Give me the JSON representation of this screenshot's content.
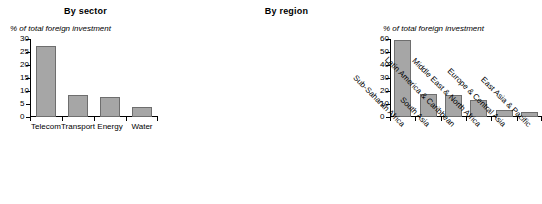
{
  "chart_data": [
    {
      "type": "bar",
      "title": "By sector",
      "ylabel": "% of total foreign investment",
      "xlabel": "",
      "categories": [
        "Telecom",
        "Transport",
        "Energy",
        "Water"
      ],
      "values": [
        27.5,
        8.3,
        7.8,
        4.0
      ],
      "ylim": [
        0,
        30
      ],
      "yticks": [
        0,
        5,
        10,
        15,
        20,
        25,
        30
      ],
      "ytick_labels": [
        "0",
        "5",
        "10",
        "15",
        "20",
        "25",
        "30"
      ],
      "grid": false,
      "legend": "none",
      "bar_color": "#a6a6a6",
      "bar_edge_color": "#6e6e6e",
      "label_rotation": 0
    },
    {
      "type": "bar",
      "title": "By region",
      "ylabel": "% of total foreign investment",
      "xlabel": "",
      "categories": [
        "Sub-Saharan Africa",
        "South Asia",
        "Latin America & Caribbean",
        "Middle East & North Africa",
        "Europe & Central Asia",
        "East Asia & Pacific"
      ],
      "values": [
        59.5,
        17.5,
        17.0,
        13.0,
        5.5,
        4.0
      ],
      "ylim": [
        0,
        60
      ],
      "yticks": [
        0,
        10,
        20,
        30,
        40,
        50,
        60
      ],
      "ytick_labels": [
        "0",
        "10",
        "20",
        "30",
        "40",
        "50",
        "60"
      ],
      "grid": false,
      "legend": "none",
      "bar_color": "#a6a6a6",
      "bar_edge_color": "#6e6e6e",
      "label_rotation": -45
    }
  ],
  "panels": {
    "sector": {
      "title": "By sector",
      "caption": "% of total foreign investment"
    },
    "region": {
      "title": "By region",
      "caption": "% of total foreign investment"
    }
  }
}
